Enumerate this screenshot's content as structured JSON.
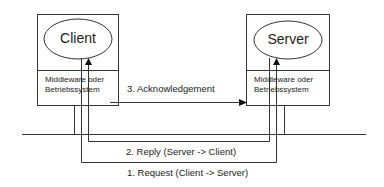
{
  "client": {
    "title": "Client",
    "middleware_line1": "Middleware oder",
    "middleware_line2": "Betriebssystem"
  },
  "server": {
    "title": "Server",
    "middleware_line1": "Middleware oder",
    "middleware_line2": "Betriebssystem"
  },
  "messages": {
    "acknowledgement": "3. Acknowledgement",
    "reply": "2. Reply (Server -> Client)",
    "request": "1. Request (Client -> Server)"
  },
  "colors": {
    "line": "#333333",
    "background": "#ffffff"
  }
}
